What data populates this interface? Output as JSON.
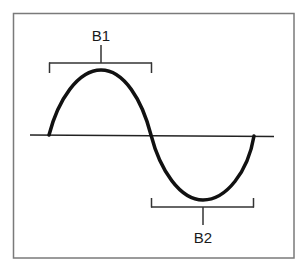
{
  "diagram": {
    "type": "sine-wave-with-brackets",
    "colors": {
      "background": "#ffffff",
      "frame": "#7a7a7a",
      "wave": "#111111",
      "axis": "#222222",
      "bracket": "#333333",
      "label": "#1a1a1a"
    },
    "frame": {
      "x": 13,
      "y": 13,
      "width": 281,
      "height": 245
    },
    "axis": {
      "y": 135.5,
      "x_start": 30,
      "x_end": 274
    },
    "wave": {
      "start": [
        49,
        135
      ],
      "peak": [
        101,
        70
      ],
      "zero_crossing": [
        151,
        135
      ],
      "trough": [
        203,
        200
      ],
      "end": [
        254,
        136
      ]
    },
    "brackets": [
      {
        "id": "B1",
        "label": "B1",
        "position": "above-crest",
        "x_start": 49,
        "x_end": 152,
        "bar_y": 63,
        "tick_end_y": 73,
        "stem_x": 101,
        "stem_top_y": 45,
        "label_x": 101,
        "label_y": 40
      },
      {
        "id": "B2",
        "label": "B2",
        "position": "below-trough",
        "x_start": 151,
        "x_end": 254,
        "bar_y": 207,
        "tick_end_y": 198,
        "stem_x": 203,
        "stem_bottom_y": 225,
        "label_x": 203,
        "label_y": 242
      }
    ]
  }
}
